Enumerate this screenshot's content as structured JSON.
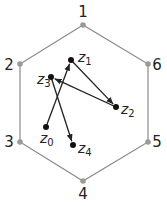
{
  "diagram": {
    "hexagon": {
      "color": "#8a8a8a",
      "vertices": [
        {
          "label": "1",
          "x": 83,
          "y": 25,
          "lx": 83,
          "ly": 17
        },
        {
          "label": "2",
          "x": 20,
          "y": 64,
          "lx": 9,
          "ly": 70
        },
        {
          "label": "3",
          "x": 20,
          "y": 142,
          "lx": 9,
          "ly": 147
        },
        {
          "label": "4",
          "x": 83,
          "y": 181,
          "lx": 83,
          "ly": 199
        },
        {
          "label": "5",
          "x": 148,
          "y": 142,
          "lx": 157,
          "ly": 147
        },
        {
          "label": "6",
          "x": 148,
          "y": 64,
          "lx": 157,
          "ly": 70
        }
      ]
    },
    "points": [
      {
        "name": "z",
        "sub": "0",
        "x": 46,
        "y": 127,
        "lx": 40,
        "ly": 143
      },
      {
        "name": "z",
        "sub": "1",
        "x": 71,
        "y": 60,
        "lx": 78,
        "ly": 62
      },
      {
        "name": "z",
        "sub": "2",
        "x": 116,
        "y": 107,
        "lx": 121,
        "ly": 114
      },
      {
        "name": "z",
        "sub": "3",
        "x": 51,
        "y": 77,
        "lx": 37,
        "ly": 84
      },
      {
        "name": "z",
        "sub": "4",
        "x": 73,
        "y": 145,
        "lx": 78,
        "ly": 153
      }
    ],
    "arrows": [
      {
        "from": "z0",
        "to": "z1"
      },
      {
        "from": "z1",
        "to": "z2"
      },
      {
        "from": "z2",
        "to": "z3"
      },
      {
        "from": "z3",
        "to": "z4"
      }
    ]
  }
}
